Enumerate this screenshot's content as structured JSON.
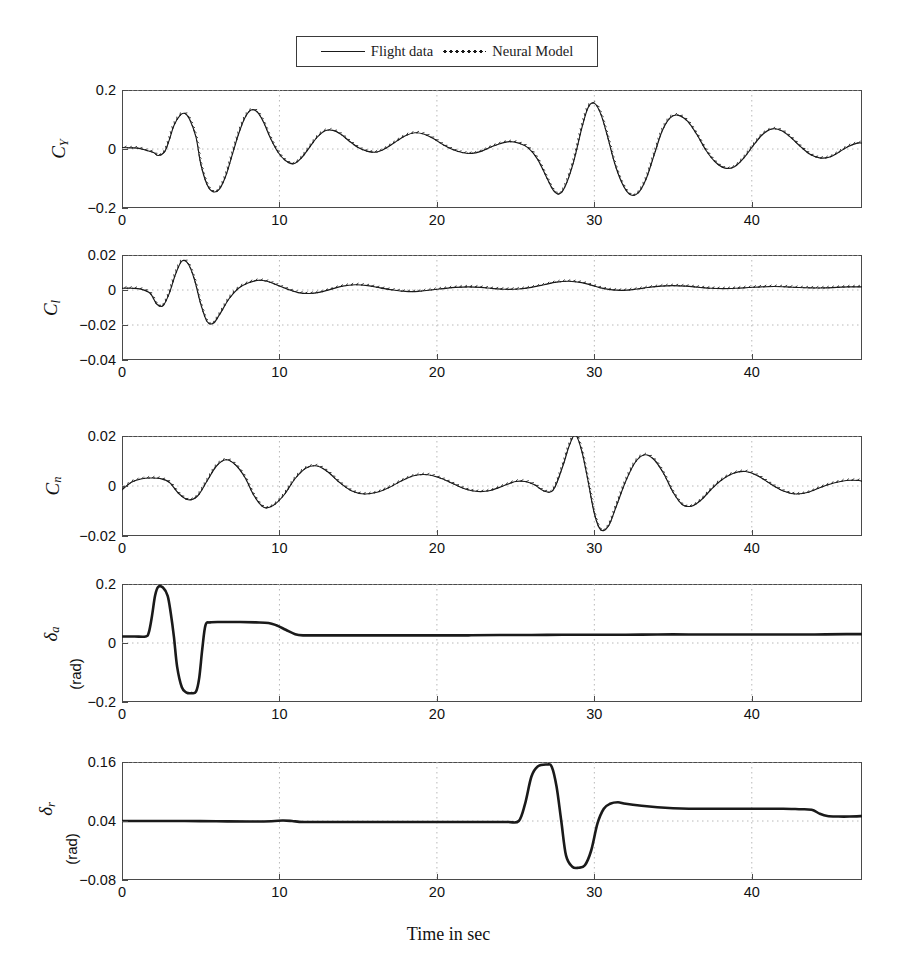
{
  "figure": {
    "xlabel": "Time in sec",
    "legend": [
      {
        "label": "Flight data",
        "style": "solid"
      },
      {
        "label": "Neural Model",
        "style": "dotted"
      }
    ],
    "colors": {
      "line": "#1a1a1a",
      "axis": "#4a4a4a",
      "grid": "#b8b8b8"
    }
  },
  "chart_data": [
    {
      "type": "line",
      "title": "",
      "ylabel": "C_Y",
      "ylabel_main": "C",
      "ylabel_sub": "Y",
      "units": "",
      "xlabel": "Time in sec",
      "xlim": [
        0,
        47
      ],
      "ylim": [
        -0.2,
        0.2
      ],
      "xticks": [
        0,
        10,
        20,
        30,
        40
      ],
      "yticks": [
        -0.2,
        0,
        0.2
      ],
      "ytick_labels": [
        "-0.2",
        "0",
        "0.2"
      ],
      "grid": true,
      "series": [
        {
          "name": "Flight data",
          "style": "solid",
          "x": [
            0,
            0.5,
            1,
            1.5,
            2,
            2.3,
            2.7,
            3,
            3.3,
            3.7,
            4,
            4.3,
            4.7,
            5,
            5.4,
            5.8,
            6.2,
            6.6,
            7,
            7.4,
            7.8,
            8.2,
            8.6,
            9,
            9.4,
            9.9,
            10.4,
            10.9,
            11.4,
            11.9,
            12.4,
            12.9,
            13.4,
            13.9,
            14.4,
            15,
            15.6,
            16.2,
            16.8,
            17.4,
            18,
            18.6,
            19.2,
            19.8,
            20.4,
            21,
            21.6,
            22.2,
            22.8,
            23.4,
            24,
            24.6,
            25.2,
            25.8,
            26.4,
            27,
            27.4,
            27.8,
            28.2,
            28.7,
            29.2,
            29.6,
            30,
            30.4,
            30.8,
            31.3,
            31.8,
            32.3,
            32.8,
            33.3,
            33.8,
            34.3,
            34.8,
            35.3,
            35.9,
            36.5,
            37.1,
            37.7,
            38.3,
            38.9,
            39.5,
            40.1,
            40.7,
            41.3,
            41.9,
            42.5,
            43.1,
            43.7,
            44.3,
            44.9,
            45.5,
            46.1,
            46.7,
            47
          ],
          "y": [
            0.005,
            0.004,
            0.003,
            -0.004,
            -0.012,
            -0.022,
            -0.01,
            0.03,
            0.08,
            0.115,
            0.12,
            0.1,
            0.04,
            -0.05,
            -0.12,
            -0.145,
            -0.135,
            -0.09,
            -0.02,
            0.05,
            0.105,
            0.132,
            0.125,
            0.09,
            0.04,
            -0.01,
            -0.04,
            -0.05,
            -0.03,
            0.005,
            0.04,
            0.062,
            0.063,
            0.05,
            0.028,
            0.005,
            -0.008,
            -0.01,
            0.004,
            0.025,
            0.045,
            0.055,
            0.05,
            0.035,
            0.014,
            -0.002,
            -0.012,
            -0.015,
            -0.008,
            0.006,
            0.018,
            0.025,
            0.02,
            0.004,
            -0.035,
            -0.1,
            -0.14,
            -0.152,
            -0.12,
            -0.04,
            0.07,
            0.14,
            0.155,
            0.12,
            0.05,
            -0.05,
            -0.12,
            -0.155,
            -0.148,
            -0.1,
            -0.02,
            0.06,
            0.105,
            0.115,
            0.095,
            0.05,
            -0.005,
            -0.045,
            -0.065,
            -0.06,
            -0.03,
            0.012,
            0.05,
            0.068,
            0.062,
            0.038,
            0.008,
            -0.018,
            -0.03,
            -0.028,
            -0.012,
            0.008,
            0.02,
            0.02,
            0.012
          ]
        },
        {
          "name": "Neural Model",
          "style": "dotted",
          "note": "Overlays the flight data closely with small high-frequency tick deviations along the same trajectory"
        }
      ]
    },
    {
      "type": "line",
      "title": "",
      "ylabel": "C_l",
      "ylabel_main": "C",
      "ylabel_sub": "l",
      "units": "",
      "xlabel": "Time in sec",
      "xlim": [
        0,
        47
      ],
      "ylim": [
        -0.04,
        0.02
      ],
      "xticks": [
        0,
        10,
        20,
        30,
        40
      ],
      "yticks": [
        -0.04,
        -0.02,
        0,
        0.02
      ],
      "ytick_labels": [
        "-0.04",
        "-0.02",
        "0",
        "0.02"
      ],
      "grid": true,
      "series": [
        {
          "name": "Flight data",
          "style": "solid",
          "x": [
            0,
            0.6,
            1.2,
            1.8,
            2.2,
            2.6,
            3,
            3.4,
            3.8,
            4.2,
            4.6,
            5,
            5.4,
            5.8,
            6.2,
            6.8,
            7.4,
            8,
            8.6,
            9.2,
            9.8,
            10.5,
            11.2,
            11.9,
            12.6,
            13.3,
            14,
            14.8,
            15.6,
            16.4,
            17.2,
            18,
            18.8,
            19.6,
            20.4,
            21.2,
            22,
            22.8,
            23.6,
            24.4,
            25.2,
            26,
            26.8,
            27.6,
            28.4,
            29.2,
            29.8,
            30.4,
            31,
            31.8,
            32.6,
            33.4,
            34.2,
            35,
            35.8,
            36.6,
            37.4,
            38.2,
            39,
            39.8,
            40.6,
            41.4,
            42.2,
            43,
            43.8,
            44.6,
            45.4,
            46.2,
            47
          ],
          "y": [
            0.001,
            0.001,
            0.0005,
            -0.002,
            -0.008,
            -0.009,
            -0.002,
            0.009,
            0.0165,
            0.015,
            0.006,
            -0.008,
            -0.018,
            -0.019,
            -0.014,
            -0.005,
            0.001,
            0.004,
            0.0055,
            0.005,
            0.003,
            0.0005,
            -0.0015,
            -0.002,
            -0.0012,
            0.0005,
            0.0022,
            0.003,
            0.0025,
            0.0012,
            0,
            -0.0008,
            -0.0008,
            0,
            0.0008,
            0.0015,
            0.0018,
            0.0015,
            0.0008,
            0.0004,
            0.0006,
            0.0015,
            0.003,
            0.0045,
            0.005,
            0.0042,
            0.0028,
            0.0012,
            0.0002,
            -0.0002,
            0.0004,
            0.0014,
            0.0022,
            0.0025,
            0.0022,
            0.0016,
            0.001,
            0.0008,
            0.001,
            0.0014,
            0.0018,
            0.002,
            0.0018,
            0.0014,
            0.0012,
            0.0012,
            0.0015,
            0.0018,
            0.0018
          ]
        },
        {
          "name": "Neural Model",
          "style": "dotted",
          "note": "Closely tracks flight data; slight offset below the solid line in the 9-16 s interval"
        }
      ]
    },
    {
      "type": "line",
      "title": "",
      "ylabel": "C_n",
      "ylabel_main": "C",
      "ylabel_sub": "n",
      "units": "",
      "xlabel": "Time in sec",
      "xlim": [
        0,
        47
      ],
      "ylim": [
        -0.02,
        0.02
      ],
      "xticks": [
        0,
        10,
        20,
        30,
        40
      ],
      "yticks": [
        -0.02,
        0,
        0.02
      ],
      "ytick_labels": [
        "-0.02",
        "0",
        "0.02"
      ],
      "grid": true,
      "series": [
        {
          "name": "Flight data",
          "style": "solid",
          "x": [
            0,
            0.6,
            1.2,
            1.8,
            2.4,
            3,
            3.6,
            4.2,
            4.8,
            5.4,
            6,
            6.6,
            7.2,
            7.8,
            8.4,
            9,
            9.6,
            10.3,
            11,
            11.7,
            12.4,
            13.1,
            13.8,
            14.6,
            15.4,
            16.2,
            17,
            17.8,
            18.6,
            19.4,
            20.2,
            21,
            21.8,
            22.6,
            23.4,
            24.2,
            25,
            25.6,
            26.2,
            26.8,
            27.4,
            28,
            28.4,
            28.8,
            29.2,
            29.6,
            30,
            30.4,
            30.9,
            31.4,
            32,
            32.6,
            33.2,
            33.8,
            34.4,
            35,
            35.6,
            36.2,
            36.8,
            37.4,
            38,
            38.8,
            39.6,
            40.4,
            41.2,
            42,
            42.8,
            43.6,
            44.4,
            45.2,
            46,
            46.8,
            47
          ],
          "y": [
            -0.0015,
            0.0015,
            0.0028,
            0.0032,
            0.003,
            0.0015,
            -0.003,
            -0.0055,
            -0.004,
            0.002,
            0.008,
            0.0105,
            0.0085,
            0.0035,
            -0.004,
            -0.0085,
            -0.0078,
            -0.0035,
            0.003,
            0.0072,
            0.008,
            0.0055,
            0.0015,
            -0.002,
            -0.0032,
            -0.0025,
            -0.0005,
            0.0022,
            0.0042,
            0.0045,
            0.0032,
            0.001,
            -0.0012,
            -0.0022,
            -0.0018,
            0,
            0.0018,
            0.0018,
            0.0005,
            -0.002,
            -0.0015,
            0.008,
            0.016,
            0.0205,
            0.014,
            0.002,
            -0.011,
            -0.0175,
            -0.016,
            -0.008,
            0.002,
            0.0095,
            0.0125,
            0.0105,
            0.005,
            -0.0025,
            -0.0075,
            -0.008,
            -0.0055,
            -0.0015,
            0.002,
            0.005,
            0.0058,
            0.004,
            0.0008,
            -0.002,
            -0.0032,
            -0.0025,
            -0.0005,
            0.0012,
            0.0022,
            0.0022,
            0.0018
          ]
        },
        {
          "name": "Neural Model",
          "style": "dotted",
          "note": "Overlays flight data with fine tick-mark deviations; slight overshoot near the 28.3 s peak"
        }
      ]
    },
    {
      "type": "line",
      "title": "",
      "ylabel": "delta_a",
      "ylabel_main": "δ",
      "ylabel_sub": "a",
      "units": "(rad)",
      "xlabel": "Time in sec",
      "xlim": [
        0,
        47
      ],
      "ylim": [
        -0.2,
        0.2
      ],
      "xticks": [
        0,
        10,
        20,
        30,
        40
      ],
      "yticks": [
        -0.2,
        0,
        0.2
      ],
      "ytick_labels": [
        "-0.2",
        "0",
        "0.2"
      ],
      "grid": true,
      "series": [
        {
          "name": "Flight data",
          "style": "solid",
          "x": [
            0,
            0.8,
            1.5,
            1.7,
            1.9,
            2.1,
            2.3,
            2.6,
            2.9,
            3.1,
            3.3,
            3.5,
            3.8,
            4.1,
            4.4,
            4.7,
            4.9,
            5.1,
            5.3,
            5.6,
            6.5,
            7.5,
            8.5,
            9.3,
            9.8,
            10.4,
            11,
            11.5,
            12.5,
            14,
            16,
            18,
            20,
            22,
            24,
            26,
            28,
            30,
            32,
            34,
            36,
            38,
            40,
            42,
            44,
            46,
            47
          ],
          "y": [
            0.022,
            0.022,
            0.022,
            0.035,
            0.09,
            0.16,
            0.19,
            0.188,
            0.16,
            0.1,
            0.02,
            -0.08,
            -0.15,
            -0.168,
            -0.17,
            -0.165,
            -0.12,
            -0.02,
            0.06,
            0.07,
            0.071,
            0.071,
            0.07,
            0.068,
            0.06,
            0.045,
            0.03,
            0.026,
            0.026,
            0.026,
            0.026,
            0.026,
            0.026,
            0.026,
            0.027,
            0.027,
            0.028,
            0.028,
            0.028,
            0.029,
            0.029,
            0.029,
            0.029,
            0.029,
            0.029,
            0.03,
            0.03
          ]
        }
      ]
    },
    {
      "type": "line",
      "title": "",
      "ylabel": "delta_r",
      "ylabel_main": "δ",
      "ylabel_sub": "r",
      "units": "(rad)",
      "xlabel": "Time in sec",
      "xlim": [
        0,
        47
      ],
      "ylim": [
        -0.08,
        0.16
      ],
      "xticks": [
        0,
        10,
        20,
        30,
        40
      ],
      "yticks": [
        -0.08,
        0.04,
        0.16
      ],
      "ytick_labels": [
        "-0.08",
        "0.04",
        "0.16"
      ],
      "grid": true,
      "series": [
        {
          "name": "Flight data",
          "style": "solid",
          "x": [
            0,
            2,
            4,
            6,
            8,
            9.5,
            10.2,
            10.8,
            11.5,
            13,
            15,
            17,
            19,
            21,
            23,
            24.5,
            25.2,
            25.6,
            26,
            26.4,
            27,
            27.3,
            27.6,
            27.9,
            28.2,
            28.6,
            29,
            29.4,
            29.8,
            30.2,
            30.6,
            31,
            31.5,
            32,
            33,
            34,
            35,
            36,
            37,
            38,
            39,
            40,
            41,
            42,
            43,
            43.8,
            44.3,
            44.8,
            45.5,
            46.2,
            47
          ],
          "y": [
            0.04,
            0.04,
            0.04,
            0.0395,
            0.039,
            0.0395,
            0.041,
            0.04,
            0.038,
            0.038,
            0.038,
            0.038,
            0.038,
            0.038,
            0.038,
            0.038,
            0.04,
            0.075,
            0.13,
            0.151,
            0.155,
            0.15,
            0.11,
            0.04,
            -0.03,
            -0.053,
            -0.055,
            -0.05,
            -0.02,
            0.035,
            0.065,
            0.075,
            0.078,
            0.075,
            0.071,
            0.068,
            0.066,
            0.065,
            0.065,
            0.065,
            0.065,
            0.065,
            0.065,
            0.065,
            0.064,
            0.063,
            0.055,
            0.05,
            0.049,
            0.049,
            0.05
          ]
        }
      ]
    }
  ]
}
